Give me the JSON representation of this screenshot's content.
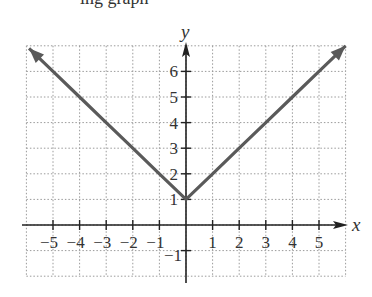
{
  "header": {
    "partial_text": "ing graph"
  },
  "chart_data": {
    "type": "line",
    "title": "",
    "function": "y = |x| + 1",
    "xlabel": "x",
    "ylabel": "y",
    "xlim": [
      -6,
      6
    ],
    "ylim": [
      -2,
      7
    ],
    "grid": true,
    "grid_style": "dotted",
    "x_ticks": [
      -5,
      -4,
      -3,
      -2,
      -1,
      1,
      2,
      3,
      4,
      5
    ],
    "x_tick_labels": [
      "−5",
      "−4",
      "−3",
      "−2",
      "−1",
      "1",
      "2",
      "3",
      "4",
      "5"
    ],
    "y_ticks": [
      -1,
      1,
      2,
      3,
      4,
      5,
      6
    ],
    "y_tick_labels": [
      "−1",
      "1",
      "2",
      "3",
      "4",
      "5",
      "6"
    ],
    "series": [
      {
        "name": "y = |x| + 1",
        "color": "#5a5a5a",
        "x": [
          -5.9,
          -5,
          -4,
          -3,
          -2,
          -1,
          0,
          1,
          2,
          3,
          4,
          5,
          6.0
        ],
        "y": [
          6.9,
          6,
          5,
          4,
          3,
          2,
          1,
          2,
          3,
          4,
          5,
          6,
          7.0
        ],
        "vertex": [
          0,
          1
        ],
        "arrows_both_ends": true
      }
    ]
  },
  "colors": {
    "curve": "#5a5a5a",
    "axes": "#222222",
    "grid": "#9a9a9a",
    "text": "#333333"
  }
}
